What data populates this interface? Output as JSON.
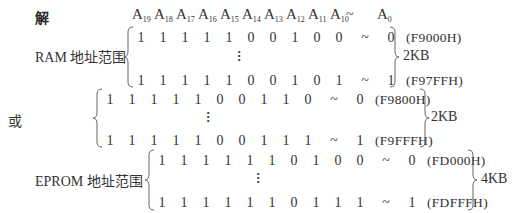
{
  "solution_label": "解",
  "header": {
    "lines": [
      "A19",
      "A18",
      "A17",
      "A16",
      "A15",
      "A14",
      "A13",
      "A12",
      "A11",
      "A10"
    ],
    "tilde": "~",
    "last": "A0"
  },
  "groups": [
    {
      "label": "RAM 地址范围",
      "start_bits": [
        "1",
        "1",
        "1",
        "1",
        "1",
        "0",
        "0",
        "1",
        "0",
        "0"
      ],
      "start_tail": "0",
      "start_hex": "(F9000H)",
      "end_bits": [
        "1",
        "1",
        "1",
        "1",
        "1",
        "0",
        "0",
        "1",
        "0",
        "1"
      ],
      "end_tail": "1",
      "end_hex": "(F97FFH)",
      "vdots": "⋮",
      "size": "2KB"
    },
    {
      "label": "或",
      "start_bits": [
        "1",
        "1",
        "1",
        "1",
        "1",
        "0",
        "0",
        "1",
        "1",
        "0"
      ],
      "start_tail": "0",
      "start_hex": "(F9800H)",
      "end_bits": [
        "1",
        "1",
        "1",
        "1",
        "1",
        "0",
        "0",
        "1",
        "1",
        "1"
      ],
      "end_tail": "1",
      "end_hex": "(F9FFFH)",
      "vdots": "⋮",
      "size": "2KB"
    },
    {
      "label": "EPROM 地址范围",
      "start_bits": [
        "1",
        "1",
        "1",
        "1",
        "1",
        "1",
        "0",
        "1",
        "0",
        "0"
      ],
      "start_tail": "0",
      "start_hex": "(FD000H)",
      "end_bits": [
        "1",
        "1",
        "1",
        "1",
        "1",
        "1",
        "0",
        "1",
        "1",
        "1"
      ],
      "end_tail": "1",
      "end_hex": "(FDFFFH)",
      "vdots": "⋮",
      "size": "4KB"
    }
  ],
  "tilde": "~"
}
